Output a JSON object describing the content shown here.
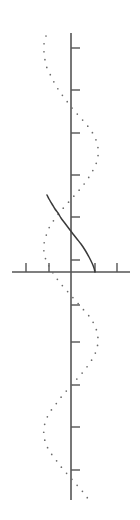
{
  "figure": {
    "width": 140,
    "height": 520,
    "background": "#ffffff"
  },
  "colors": {
    "axis": "#555555",
    "tick": "#555555",
    "solid_curve": "#3a3a3a",
    "dotted_curve": "#6b6b6b"
  },
  "axes": {
    "vertical": {
      "name": "vertical-axis",
      "x": 71,
      "y_start": 33,
      "y_end": 500,
      "stroke_width": 1.6,
      "tick_length": 9,
      "tick_side": "right",
      "tick_positions": [
        48,
        90,
        133,
        175,
        217,
        260,
        305,
        342,
        385,
        427,
        470
      ]
    },
    "horizontal": {
      "name": "horizontal-axis",
      "y": 272,
      "x_start": 12,
      "x_end": 130,
      "stroke_width": 1.4,
      "tick_length": 9,
      "tick_side": "up",
      "tick_positions": [
        26,
        49,
        95,
        117
      ]
    }
  },
  "chart_data": {
    "type": "line",
    "title": "",
    "subtitle": "",
    "xlabel": "",
    "ylabel": "",
    "orientation": "vertical",
    "grid": false,
    "legend": null,
    "annotations": [],
    "axis_origin_px": {
      "x": 71,
      "y": 272
    },
    "axis_ranges": {
      "horizontal_px": [
        12,
        130
      ],
      "vertical_px": [
        33,
        500
      ]
    },
    "series": [
      {
        "name": "dotted-sinusoid",
        "style": "dotted",
        "color": "#6b6b6b",
        "dot_radius": 0.85,
        "dot_spacing_px": 8,
        "amplitude_px": 27,
        "period_px": 150,
        "phase_deg": 120,
        "center_x_px": 71,
        "y_start_px": 34,
        "y_end_px": 500,
        "points": [
          [
            46,
            36
          ],
          [
            44,
            44
          ],
          [
            44,
            52
          ],
          [
            45,
            60
          ],
          [
            47,
            68
          ],
          [
            51,
            76
          ],
          [
            55,
            84
          ],
          [
            60,
            92
          ],
          [
            66,
            100
          ],
          [
            72,
            108
          ],
          [
            79,
            116
          ],
          [
            86,
            124
          ],
          [
            92,
            132
          ],
          [
            96,
            140
          ],
          [
            98,
            148
          ],
          [
            98,
            156
          ],
          [
            96,
            164
          ],
          [
            92,
            172
          ],
          [
            87,
            180
          ],
          [
            81,
            188
          ],
          [
            74,
            196
          ],
          [
            67,
            204
          ],
          [
            60,
            212
          ],
          [
            54,
            220
          ],
          [
            49,
            228
          ],
          [
            46,
            236
          ],
          [
            44,
            244
          ],
          [
            44,
            252
          ],
          [
            46,
            260
          ],
          [
            50,
            268
          ],
          [
            55,
            276
          ],
          [
            61,
            284
          ],
          [
            68,
            292
          ],
          [
            75,
            300
          ],
          [
            82,
            308
          ],
          [
            89,
            316
          ],
          [
            94,
            324
          ],
          [
            97,
            332
          ],
          [
            98,
            340
          ],
          [
            97,
            348
          ],
          [
            94,
            356
          ],
          [
            89,
            364
          ],
          [
            83,
            372
          ],
          [
            76,
            380
          ],
          [
            69,
            388
          ],
          [
            62,
            396
          ],
          [
            56,
            404
          ],
          [
            50,
            412
          ],
          [
            46,
            420
          ],
          [
            44,
            428
          ],
          [
            44,
            436
          ],
          [
            46,
            444
          ],
          [
            50,
            452
          ],
          [
            56,
            460
          ],
          [
            62,
            468
          ],
          [
            69,
            476
          ],
          [
            76,
            484
          ],
          [
            83,
            492
          ],
          [
            89,
            500
          ]
        ]
      },
      {
        "name": "solid-s-curve",
        "style": "solid",
        "color": "#3a3a3a",
        "stroke_width": 1.5,
        "start_px": [
          47,
          195
        ],
        "inflection_px": [
          71,
          232
        ],
        "end_px": [
          95,
          272
        ],
        "points": [
          [
            47,
            195
          ],
          [
            49,
            199
          ],
          [
            52,
            204
          ],
          [
            55,
            209
          ],
          [
            58,
            213
          ],
          [
            61,
            218
          ],
          [
            64,
            222
          ],
          [
            67,
            226
          ],
          [
            70,
            230
          ],
          [
            73,
            234
          ],
          [
            77,
            239
          ],
          [
            81,
            244
          ],
          [
            85,
            250
          ],
          [
            89,
            257
          ],
          [
            92,
            263
          ],
          [
            94,
            268
          ],
          [
            95,
            272
          ]
        ]
      }
    ]
  }
}
